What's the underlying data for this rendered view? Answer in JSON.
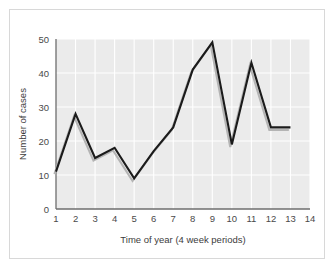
{
  "chart_data": {
    "type": "line",
    "title": "",
    "xlabel": "Time of year (4 week periods)",
    "ylabel": "Number of cases",
    "x": [
      1,
      2,
      3,
      4,
      5,
      6,
      7,
      8,
      9,
      10,
      11,
      12,
      13
    ],
    "values": [
      11,
      28,
      15,
      18,
      9,
      17,
      24,
      41,
      49,
      19,
      43,
      24,
      24
    ],
    "categories": [
      "1",
      "2",
      "3",
      "4",
      "5",
      "6",
      "7",
      "8",
      "9",
      "10",
      "11",
      "12",
      "13"
    ],
    "xticks": [
      "1",
      "2",
      "3",
      "4",
      "5",
      "6",
      "7",
      "8",
      "9",
      "10",
      "11",
      "12",
      "13",
      "14"
    ],
    "yticks": [
      "0",
      "10",
      "20",
      "30",
      "40",
      "50"
    ],
    "xlim": [
      1,
      14
    ],
    "ylim": [
      0,
      50
    ],
    "grid": true,
    "legend": "none",
    "series": [
      {
        "name": "Number of cases",
        "values": [
          11,
          28,
          15,
          18,
          9,
          17,
          24,
          41,
          49,
          19,
          43,
          24,
          24
        ]
      }
    ],
    "colors": {
      "line": "#1b1b1b",
      "line_shadow": "#b4b4b4",
      "plot_background": "#ebebeb",
      "gridline": "#ffffff",
      "axis": "#6e6e6e",
      "text": "#4a4a4a",
      "figure_border": "#d8d8d8"
    }
  },
  "axis": {
    "x_title": "Time of year (4 week periods)",
    "y_title": "Number of cases"
  },
  "ticks": {
    "y": [
      "50",
      "40",
      "30",
      "20",
      "10",
      "0"
    ],
    "x": [
      "1",
      "2",
      "3",
      "4",
      "5",
      "6",
      "7",
      "8",
      "9",
      "10",
      "11",
      "12",
      "13",
      "14"
    ]
  }
}
